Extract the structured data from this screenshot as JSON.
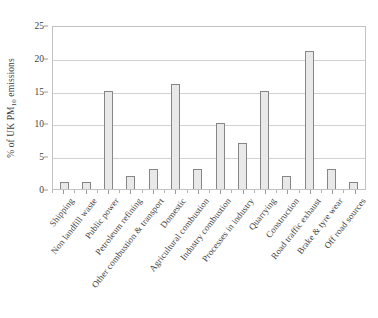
{
  "chart_data": {
    "type": "bar",
    "title": "",
    "subtitle": "",
    "xlabel": "",
    "ylabel": "% of UK PM10 emissions",
    "ylabel_prefix": "% of UK PM",
    "ylabel_sub": "10",
    "ylabel_suffix": " emissions",
    "categories": [
      "Shipping",
      "Non landfill waste",
      "Public power",
      "Petroleum refining",
      "Other combustion & transport",
      "Domestic",
      "Agricultural combustion",
      "Industry combustion",
      "Processes in industry",
      "Quarrying",
      "Construction",
      "Road traffic exhaust",
      "Brake & tyre wear",
      "Off road sources"
    ],
    "values": [
      1,
      1,
      15,
      2,
      3,
      16,
      3,
      10,
      7,
      15,
      2,
      21,
      3,
      1
    ],
    "ylim": [
      0,
      25
    ],
    "ytick_values": [
      0,
      5,
      10,
      15,
      20,
      25
    ],
    "ytick_labels": [
      "0",
      "5",
      "10",
      "15",
      "20",
      "25"
    ],
    "grid": true,
    "grid_axis": "y",
    "legend": false,
    "bar_fill_color": "#e9e9e9",
    "bar_edge_color": "#868686",
    "gridline_color": "#d2d2d2",
    "axis_color": "#c2c2c2",
    "text_color": "#3f3f3f"
  }
}
